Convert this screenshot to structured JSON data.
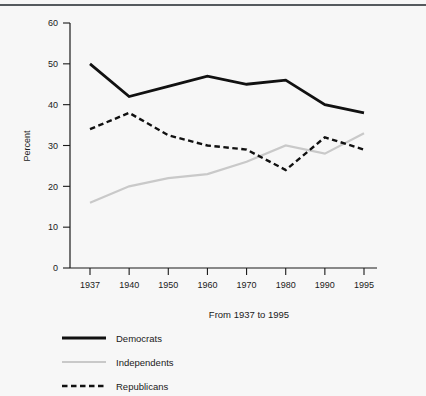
{
  "chart_data": {
    "type": "line",
    "title": "",
    "xlabel": "From 1937 to 1995",
    "ylabel": "Percent",
    "categories": [
      "1937",
      "1940",
      "1950",
      "1960",
      "1970",
      "1980",
      "1990",
      "1995"
    ],
    "x_tick_labels": [
      "1937",
      "1940",
      "1950",
      "1960",
      "1970",
      "1980",
      "1990",
      "1995"
    ],
    "y_tick_labels": [
      "0",
      "10",
      "20",
      "30",
      "40",
      "50",
      "60"
    ],
    "y_ticks": [
      0,
      10,
      20,
      30,
      40,
      50,
      60
    ],
    "ylim": [
      0,
      60
    ],
    "grid": false,
    "legend_position": "below-left",
    "series": [
      {
        "name": "Democrats",
        "values": [
          50,
          42,
          44.5,
          47,
          45,
          46,
          40,
          38
        ],
        "color": "#111111",
        "style": "solid",
        "width": 2.8
      },
      {
        "name": "Independents",
        "values": [
          16,
          20,
          22,
          23,
          26,
          30,
          28,
          33
        ],
        "color": "#c9c9c9",
        "style": "solid",
        "width": 2.2
      },
      {
        "name": "Republicans",
        "values": [
          34,
          38,
          32.5,
          30,
          29,
          24,
          32,
          29
        ],
        "color": "#111111",
        "style": "dashed",
        "width": 2.4
      }
    ]
  },
  "legend": {
    "items": [
      {
        "label": "Democrats",
        "color": "#111111",
        "style": "solid"
      },
      {
        "label": "Independents",
        "color": "#c9c9c9",
        "style": "solid"
      },
      {
        "label": "Republicans",
        "color": "#111111",
        "style": "dashed"
      }
    ]
  },
  "axes": {
    "y_title": "Percent",
    "x_title": "From 1937 to 1995"
  }
}
